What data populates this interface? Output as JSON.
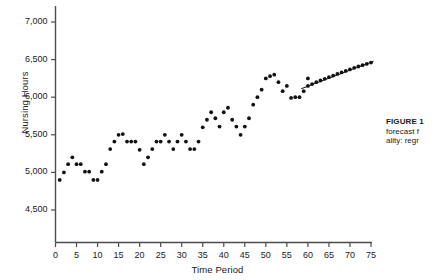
{
  "chart_data": {
    "type": "scatter",
    "title": "",
    "xlabel": "Time Period",
    "ylabel": "Nursing Hours",
    "xlim": [
      0,
      76
    ],
    "ylim": [
      4300,
      7150
    ],
    "xticks": [
      0,
      5,
      10,
      15,
      20,
      25,
      30,
      35,
      40,
      45,
      50,
      55,
      60,
      65,
      70,
      75
    ],
    "xtick_labels": [
      "0",
      "5",
      "10",
      "15",
      "20",
      "25",
      "30",
      "35",
      "40",
      "45",
      "50",
      "55",
      "60",
      "65",
      "70",
      "75"
    ],
    "yticks": [
      4500,
      5000,
      5500,
      6000,
      6500,
      7000
    ],
    "ytick_labels": [
      "4,500",
      "5,000",
      "5,500",
      "6,000",
      "6,500",
      "7,000"
    ],
    "grid": false,
    "legend": false,
    "marker_color": "#111111",
    "axis_color": "#4d4d4d",
    "line_color": "#111111",
    "series": [
      {
        "name": "Observed Nursing Hours",
        "marker": "dot",
        "x": [
          1,
          2,
          3,
          4,
          5,
          6,
          7,
          8,
          9,
          10,
          11,
          12,
          13,
          14,
          15,
          16,
          17,
          18,
          19,
          20,
          21,
          22,
          23,
          24,
          25,
          26,
          27,
          28,
          29,
          30,
          31,
          32,
          33,
          34,
          35,
          36,
          37,
          38,
          39,
          40,
          41,
          42,
          43,
          44,
          45,
          46,
          47,
          48,
          49,
          50,
          51,
          52,
          53,
          54,
          55,
          56,
          57,
          58,
          59,
          60
        ],
        "y": [
          4900,
          5000,
          5110,
          5200,
          5110,
          5110,
          5010,
          5010,
          4900,
          4900,
          5010,
          5110,
          5310,
          5410,
          5500,
          5510,
          5410,
          5410,
          5410,
          5300,
          5110,
          5200,
          5310,
          5410,
          5410,
          5500,
          5410,
          5310,
          5410,
          5500,
          5410,
          5310,
          5310,
          5410,
          5600,
          5700,
          5800,
          5720,
          5610,
          5800,
          5860,
          5700,
          5610,
          5500,
          5610,
          5720,
          5900,
          6000,
          6100,
          6250,
          6280,
          6300,
          6200,
          6080,
          6150,
          5990,
          6000,
          6000,
          6080,
          6250
        ]
      },
      {
        "name": "Regression Forecast",
        "marker": "dot-line",
        "x": [
          60,
          61,
          62,
          63,
          64,
          65,
          66,
          67,
          68,
          69,
          70,
          71,
          72,
          73,
          74,
          75
        ],
        "y": [
          6150,
          6175,
          6200,
          6222,
          6244,
          6266,
          6288,
          6310,
          6330,
          6350,
          6370,
          6390,
          6408,
          6426,
          6442,
          6460
        ]
      }
    ],
    "annotations": []
  },
  "caption": {
    "title": "FIGURE 1",
    "line_2": "forecast f",
    "line_3": "ality: regr"
  }
}
